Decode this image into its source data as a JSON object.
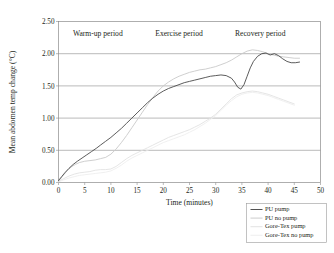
{
  "chart_data": {
    "type": "line",
    "title": "",
    "xlabel": "Time (minutes)",
    "ylabel": "Mean abdomen temp change (°C)",
    "xlim": [
      0,
      50
    ],
    "ylim": [
      0,
      2.5
    ],
    "xticks": [
      0,
      5,
      10,
      15,
      20,
      25,
      30,
      35,
      40,
      45,
      50
    ],
    "xtick_labels": [
      "0",
      "5",
      "10",
      "15",
      "20",
      "25",
      "30",
      "35",
      "40",
      "45",
      "50"
    ],
    "yticks": [
      0.0,
      0.5,
      1.0,
      1.5,
      2.0,
      2.5
    ],
    "ytick_labels": [
      "0.00",
      "0.50",
      "1.00",
      "1.50",
      "2.00",
      "2.50"
    ],
    "grid": "horizontal",
    "legend_position": "below-right",
    "annotations": [
      {
        "text": "Warm-up period",
        "x": 7.5,
        "y": 2.28
      },
      {
        "text": "Exercise period",
        "x": 23.0,
        "y": 2.28
      },
      {
        "text": "Recovery period",
        "x": 38.5,
        "y": 2.28
      }
    ],
    "series": [
      {
        "name": "PU pump",
        "color": "#4a4a4a",
        "width": 0.9,
        "x": [
          0,
          0.6,
          1.2,
          2.0,
          2.8,
          3.6,
          4.5,
          5.4,
          6.3,
          7.2,
          8.0,
          9.0,
          10.0,
          11.0,
          12.0,
          13.0,
          14.0,
          15.0,
          16.0,
          17.0,
          18.0,
          19.0,
          20.0,
          21.0,
          22.0,
          23.0,
          24.0,
          25.0,
          26.0,
          27.0,
          28.0,
          29.0,
          30.0,
          31.0,
          32.0,
          33.0,
          33.6,
          34.2,
          34.8,
          35.4,
          36.0,
          36.6,
          37.2,
          38.0,
          38.8,
          39.6,
          40.4,
          41.2,
          42.0,
          42.8,
          43.6,
          44.4,
          45.2,
          46.0
        ],
        "y": [
          0.03,
          0.09,
          0.15,
          0.22,
          0.28,
          0.33,
          0.38,
          0.43,
          0.48,
          0.53,
          0.58,
          0.64,
          0.7,
          0.77,
          0.84,
          0.92,
          1.0,
          1.08,
          1.16,
          1.24,
          1.31,
          1.37,
          1.42,
          1.46,
          1.49,
          1.52,
          1.55,
          1.57,
          1.59,
          1.61,
          1.63,
          1.65,
          1.66,
          1.67,
          1.66,
          1.62,
          1.56,
          1.48,
          1.45,
          1.52,
          1.65,
          1.78,
          1.88,
          1.96,
          2.0,
          2.01,
          1.98,
          2.0,
          1.97,
          1.92,
          1.88,
          1.86,
          1.86,
          1.87
        ]
      },
      {
        "name": "PU no pump",
        "color": "#c9c9c9",
        "width": 0.9,
        "x": [
          0,
          0.8,
          1.6,
          2.4,
          3.2,
          4.0,
          5.0,
          6.0,
          7.0,
          8.0,
          9.0,
          10.0,
          11.0,
          12.0,
          13.0,
          14.0,
          15.0,
          16.0,
          17.0,
          18.0,
          19.0,
          20.0,
          21.0,
          22.0,
          23.0,
          24.0,
          25.0,
          26.0,
          27.0,
          28.0,
          29.0,
          30.0,
          31.0,
          32.0,
          33.0,
          34.0,
          35.0,
          36.0,
          37.0,
          38.0,
          39.0,
          40.0,
          41.0,
          42.0,
          43.0,
          44.0,
          45.0,
          46.0
        ],
        "y": [
          0.02,
          0.1,
          0.18,
          0.24,
          0.28,
          0.31,
          0.33,
          0.34,
          0.35,
          0.37,
          0.39,
          0.44,
          0.52,
          0.62,
          0.73,
          0.85,
          0.97,
          1.09,
          1.21,
          1.32,
          1.42,
          1.5,
          1.56,
          1.61,
          1.65,
          1.68,
          1.71,
          1.73,
          1.75,
          1.76,
          1.78,
          1.8,
          1.83,
          1.86,
          1.9,
          1.95,
          2.0,
          2.04,
          2.06,
          2.05,
          2.03,
          2.0,
          1.98,
          1.96,
          1.95,
          1.94,
          1.93,
          1.93
        ]
      },
      {
        "name": "Gore-Tex pump",
        "color": "#e2e2e2",
        "width": 0.9,
        "x": [
          0,
          1.0,
          2.0,
          3.0,
          4.0,
          5.0,
          6.0,
          7.0,
          8.0,
          9.0,
          10.0,
          11.0,
          12.0,
          13.0,
          14.0,
          15.0,
          16.0,
          17.0,
          18.0,
          19.0,
          20.0,
          21.0,
          22.0,
          23.0,
          24.0,
          25.0,
          26.0,
          27.0,
          28.0,
          29.0,
          30.0,
          31.0,
          32.0,
          33.0,
          34.0,
          35.0,
          36.0,
          37.0,
          38.0,
          39.0,
          40.0,
          41.0,
          42.0,
          43.0,
          44.0,
          45.0
        ],
        "y": [
          0.02,
          0.06,
          0.1,
          0.13,
          0.15,
          0.16,
          0.17,
          0.19,
          0.2,
          0.2,
          0.21,
          0.25,
          0.31,
          0.37,
          0.42,
          0.46,
          0.5,
          0.54,
          0.58,
          0.62,
          0.66,
          0.7,
          0.73,
          0.76,
          0.79,
          0.82,
          0.86,
          0.9,
          0.95,
          1.0,
          1.06,
          1.14,
          1.22,
          1.3,
          1.36,
          1.39,
          1.41,
          1.42,
          1.41,
          1.39,
          1.37,
          1.34,
          1.31,
          1.28,
          1.25,
          1.22
        ]
      },
      {
        "name": "Gore-Tex no pump",
        "color": "#eeeeee",
        "width": 0.9,
        "x": [
          0,
          1.0,
          2.0,
          3.0,
          4.0,
          5.0,
          6.0,
          7.0,
          8.0,
          9.0,
          10.0,
          11.0,
          12.0,
          13.0,
          14.0,
          15.0,
          16.0,
          17.0,
          18.0,
          19.0,
          20.0,
          21.0,
          22.0,
          23.0,
          24.0,
          25.0,
          26.0,
          27.0,
          28.0,
          29.0,
          30.0,
          31.0,
          32.0,
          33.0,
          34.0,
          35.0,
          36.0,
          37.0,
          38.0,
          39.0,
          40.0,
          41.0,
          42.0,
          43.0,
          44.0,
          45.0
        ],
        "y": [
          0.01,
          0.04,
          0.07,
          0.09,
          0.11,
          0.12,
          0.13,
          0.14,
          0.15,
          0.16,
          0.18,
          0.22,
          0.27,
          0.33,
          0.38,
          0.42,
          0.46,
          0.5,
          0.54,
          0.58,
          0.62,
          0.65,
          0.68,
          0.71,
          0.74,
          0.78,
          0.82,
          0.87,
          0.92,
          0.98,
          1.04,
          1.12,
          1.2,
          1.27,
          1.33,
          1.37,
          1.39,
          1.4,
          1.39,
          1.37,
          1.35,
          1.32,
          1.29,
          1.26,
          1.23,
          1.2
        ]
      }
    ]
  },
  "legend": {
    "entries": [
      {
        "label": "PU pump",
        "color": "#4a4a4a"
      },
      {
        "label": "PU no pump",
        "color": "#c9c9c9"
      },
      {
        "label": "Gore-Tex pump",
        "color": "#e2e2e2"
      },
      {
        "label": "Gore-Tex no pump",
        "color": "#eeeeee"
      }
    ]
  }
}
